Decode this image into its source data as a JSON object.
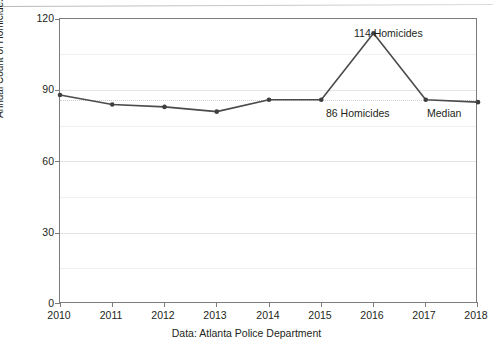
{
  "chart_data": {
    "type": "line",
    "title": "",
    "xlabel": "",
    "ylabel": "Annual Count of Homicides",
    "caption": "Data: Atlanta Police Department",
    "categories": [
      "2010",
      "2011",
      "2012",
      "2013",
      "2014",
      "2015",
      "2016",
      "2017",
      "2018"
    ],
    "values": [
      88,
      84,
      83,
      81,
      86,
      86,
      114,
      86,
      85
    ],
    "series": [
      {
        "name": "Annual Count of Homicides",
        "values": [
          88,
          84,
          83,
          81,
          86,
          86,
          114,
          86,
          85
        ]
      }
    ],
    "ylim": [
      0,
      120
    ],
    "yticks": [
      0,
      30,
      60,
      90,
      120
    ],
    "ytick_labels": [
      "0",
      "30",
      "60",
      "90",
      "120"
    ],
    "minor_yticks": [
      15,
      45,
      75,
      105
    ],
    "xtick_labels": [
      "2010",
      "2011",
      "2012",
      "2013",
      "2014",
      "2015",
      "2016",
      "2017",
      "2018"
    ],
    "grid": true,
    "legend": "none",
    "median_value": 86,
    "marker_color": "#3f3f41",
    "line_color": "#4b4b4d",
    "grid_color": "#e4e4e4",
    "axis_color": "#7c7c7c",
    "annotations": [
      {
        "id": "peak-2016",
        "text": "114 Homicides",
        "x": "2016",
        "y": 114
      },
      {
        "id": "point-2017",
        "text": "86 Homicides",
        "x": "2017",
        "y": 86
      },
      {
        "id": "median-2018",
        "text": "Median",
        "x": "2018",
        "y": 85
      }
    ]
  }
}
